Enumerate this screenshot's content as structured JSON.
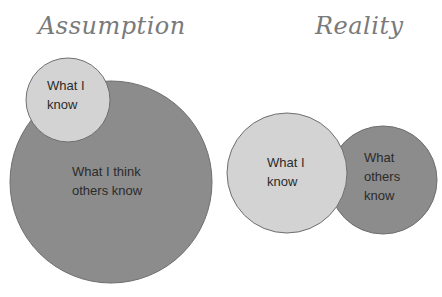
{
  "titles": {
    "left": "Assumption",
    "right": "Reality"
  },
  "colors": {
    "light_circle": "#d3d3d3",
    "dark_circle": "#8c8c8c",
    "stroke": "#6f6f6f",
    "title": "#7a7a7a"
  },
  "assumption": {
    "small_circle": {
      "label_line1": "What I",
      "label_line2": "know"
    },
    "big_circle": {
      "label_line1": "What I think",
      "label_line2": "others know"
    }
  },
  "reality": {
    "left_circle": {
      "label_line1": "What I",
      "label_line2": "know"
    },
    "right_circle": {
      "label_line1": "What",
      "label_line2": "others",
      "label_line3": "know"
    }
  }
}
